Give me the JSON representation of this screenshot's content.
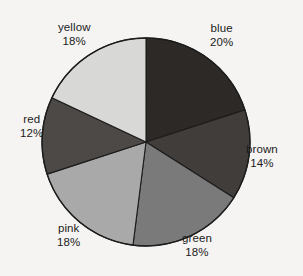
{
  "chart_data": {
    "type": "pie",
    "title": "",
    "categories": [
      "blue",
      "brown",
      "green",
      "pink",
      "red",
      "yellow"
    ],
    "values": [
      20,
      14,
      18,
      18,
      12,
      18
    ],
    "value_unit": "%",
    "slices": [
      {
        "name": "blue",
        "value": 20,
        "value_label": "20%",
        "color": "#2b2724",
        "label_x": 210,
        "label_y": 22,
        "label_align": "left"
      },
      {
        "name": "brown",
        "value": 14,
        "value_label": "14%",
        "color": "#3f3b38",
        "label_x": 246,
        "label_y": 143,
        "label_align": "left"
      },
      {
        "name": "green",
        "value": 18,
        "value_label": "18%",
        "color": "#797979",
        "label_x": 182,
        "label_y": 232,
        "label_align": "left"
      },
      {
        "name": "pink",
        "value": 18,
        "value_label": "18%",
        "color": "#a9a9a9",
        "label_x": 57,
        "label_y": 222,
        "label_align": "left"
      },
      {
        "name": "red",
        "value": 12,
        "value_label": "12%",
        "color": "#4a4744",
        "label_x": 20,
        "label_y": 113,
        "label_align": "left"
      },
      {
        "name": "yellow",
        "value": 18,
        "value_label": "18%",
        "color": "#d9d9d7",
        "label_x": 58,
        "label_y": 21,
        "label_align": "left"
      }
    ],
    "start_angle_deg": 0,
    "direction": "clockwise",
    "total": 100,
    "legend": "none",
    "grid": false,
    "background_color": "#f6f5f3",
    "outline_color": "#1a1a1a",
    "center_x": 146,
    "center_y": 142,
    "radius": 104
  }
}
